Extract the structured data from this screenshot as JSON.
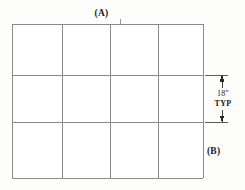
{
  "diagram": {
    "background_color": "#fdfdfc",
    "line_color": "#8a8a8a",
    "annotation_color": "#1a1a1a"
  },
  "labels": {
    "top": "(A)",
    "right": "(B)"
  },
  "dimension": {
    "value": "18\"",
    "note": "TYP",
    "icon_up": "arrow-up-icon",
    "icon_down": "arrow-down-icon"
  },
  "grid": {
    "columns": 4,
    "rows": 3,
    "left": 12,
    "right": 203,
    "top": 24,
    "bottom": 178,
    "x_lines": [
      12,
      62,
      110,
      158,
      203
    ],
    "y_lines": [
      24,
      75,
      122,
      178
    ],
    "cells": [
      [
        "cell-r1c1",
        "cell-r1c2",
        "cell-r1c3",
        "cell-r1c4"
      ],
      [
        "cell-r2c1",
        "cell-r2c2",
        "cell-r2c3",
        "cell-r2c4"
      ],
      [
        "cell-r3c1",
        "cell-r3c2",
        "cell-r3c3",
        "cell-r3c4"
      ]
    ]
  }
}
